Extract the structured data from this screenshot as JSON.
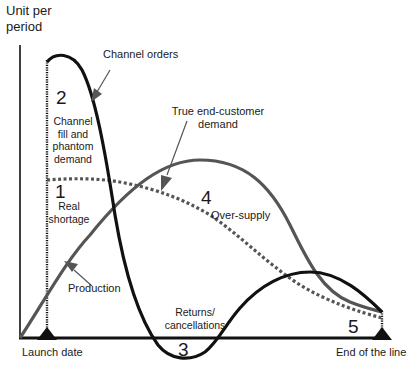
{
  "diagram": {
    "y_axis_title_line1": "Unit per",
    "y_axis_title_line2": "period",
    "x_axis": {
      "start_label": "Launch date",
      "end_label": "End of the line"
    },
    "curves": {
      "channel_orders": {
        "label": "Channel orders",
        "color": "#111111",
        "style": "solid"
      },
      "true_demand": {
        "label_line1": "True end-customer",
        "label_line2": "demand",
        "color": "#555555",
        "style": "solid"
      },
      "production": {
        "label": "Production",
        "color": "#555555",
        "style": "solid"
      },
      "dotted": {
        "color": "#555555",
        "style": "dotted"
      }
    },
    "regions": [
      {
        "number": "1",
        "line1": "Real",
        "line2": "shortage"
      },
      {
        "number": "2",
        "line1": "Channel",
        "line2": "fill and",
        "line3": "phantom",
        "line4": "demand"
      },
      {
        "number": "3",
        "line1": "Returns/",
        "line2": "cancellations"
      },
      {
        "number": "4",
        "line1": "Over-supply"
      },
      {
        "number": "5"
      }
    ],
    "colors": {
      "axis": "#111111",
      "background": "#ffffff"
    }
  }
}
